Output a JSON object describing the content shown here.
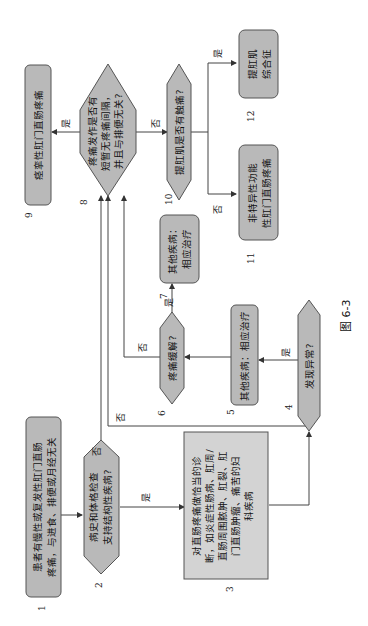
{
  "figure": {
    "caption": "图 6-3",
    "orientation": "rotated 90° counter-clockwise",
    "nodes": [
      {
        "id": 1,
        "number": "1",
        "shape": "rounded-rect",
        "lines": [
          "患者有慢性或复发性肛门直肠",
          "疼痛，与进食、排便或月经无关"
        ]
      },
      {
        "id": 2,
        "number": "2",
        "shape": "hexagon",
        "lines": [
          "病史和体格检查",
          "支持结构性疾病?"
        ]
      },
      {
        "id": 3,
        "number": "3",
        "shape": "rect",
        "lines": [
          "对直肠疼痛做恰当的诊",
          "断，如炎症性肠病、肛周/",
          "直肠周围脓肿、肛裂、肛",
          "门直肠肿瘤、痛苦的妇",
          "科疾病"
        ]
      },
      {
        "id": 4,
        "number": "4",
        "shape": "hexagon",
        "lines": [
          "发现异常?"
        ]
      },
      {
        "id": 5,
        "number": "5",
        "shape": "rounded-rect",
        "lines": [
          "其他疾病：相应治疗"
        ]
      },
      {
        "id": 6,
        "number": "6",
        "shape": "hexagon",
        "lines": [
          "疼痛缓解?"
        ]
      },
      {
        "id": 7,
        "number": "7",
        "shape": "rounded-rect",
        "lines": [
          "其他疾病：",
          "相应治疗"
        ]
      },
      {
        "id": 8,
        "number": "8",
        "shape": "hexagon",
        "lines": [
          "疼痛发作是否有",
          "短暂无疼痛间隔，",
          "并且与排便无关?"
        ]
      },
      {
        "id": 9,
        "number": "9",
        "shape": "rounded-rect",
        "lines": [
          "痉挛性肛门直肠疼痛"
        ]
      },
      {
        "id": 10,
        "number": "10",
        "shape": "hexagon",
        "lines": [
          "提肛肌是否有触痛?"
        ]
      },
      {
        "id": 11,
        "number": "11",
        "shape": "rounded-rect",
        "lines": [
          "非特异性功能",
          "性肛门直肠疼痛"
        ]
      },
      {
        "id": 12,
        "number": "12",
        "shape": "rounded-rect",
        "lines": [
          "提肛肌",
          "综合征"
        ]
      }
    ],
    "edges": [
      {
        "from": 1,
        "to": 2,
        "label": ""
      },
      {
        "from": 2,
        "to": 3,
        "label": "是"
      },
      {
        "from": 2,
        "to": 8,
        "label": "否"
      },
      {
        "from": 3,
        "to": 4,
        "label": ""
      },
      {
        "from": 4,
        "to": 5,
        "label": "是"
      },
      {
        "from": 4,
        "to": 8,
        "label": "否"
      },
      {
        "from": 5,
        "to": 6,
        "label": ""
      },
      {
        "from": 6,
        "to": 7,
        "label": "是"
      },
      {
        "from": 6,
        "to": 8,
        "label": "否"
      },
      {
        "from": 8,
        "to": 9,
        "label": "是"
      },
      {
        "from": 8,
        "to": 10,
        "label": "否"
      },
      {
        "from": 10,
        "to": 12,
        "label": "是"
      },
      {
        "from": 10,
        "to": 11,
        "label": "否"
      }
    ],
    "colors": {
      "node_fill": "#b9b9b9",
      "node3_fill": "#d3d3d3",
      "stroke": "#555555",
      "background": "#ffffff"
    }
  }
}
